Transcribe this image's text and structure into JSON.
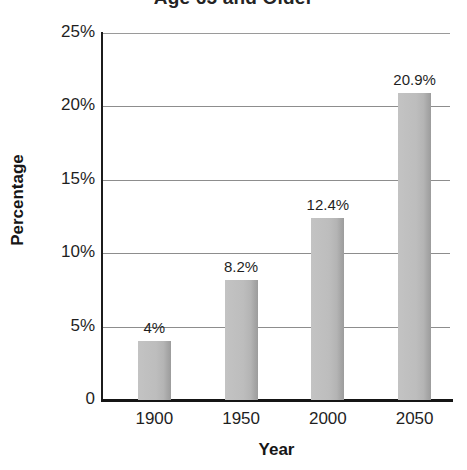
{
  "chart_data": {
    "type": "bar",
    "title": "Age 65 and Older",
    "xlabel": "Year",
    "ylabel": "Percentage",
    "categories": [
      "1900",
      "1950",
      "2000",
      "2050"
    ],
    "values": [
      4,
      8.2,
      12.4,
      20.9
    ],
    "data_labels": [
      "4%",
      "8.2%",
      "12.4%",
      "20.9%"
    ],
    "ylim": [
      0,
      25
    ],
    "ytick_values": [
      25,
      20,
      15,
      10,
      5,
      0
    ],
    "ytick_labels": [
      "25%",
      "20%",
      "15%",
      "10%",
      "5%",
      "0"
    ],
    "grid": true,
    "legend": false,
    "bar_color": "#bdbdbd",
    "axis_color": "#1c1c1c",
    "gridline_color": "#8d8d8d"
  }
}
